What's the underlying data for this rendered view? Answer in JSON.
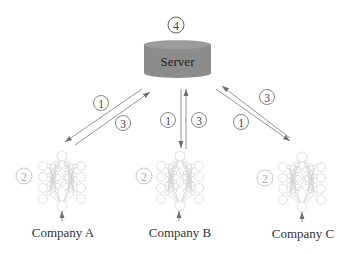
{
  "server": {
    "label": "Server",
    "step_badge": "4",
    "fill_color": "#8a8a8a",
    "top_color": "#9a9a9a"
  },
  "companies": [
    {
      "label": "Company A",
      "step_badge": "2"
    },
    {
      "label": "Company B",
      "step_badge": "2"
    },
    {
      "label": "Company C",
      "step_badge": "2"
    }
  ],
  "links": [
    {
      "company": "Company A",
      "down_step": "1",
      "up_step": "3"
    },
    {
      "company": "Company B",
      "down_step": "1",
      "up_step": "3"
    },
    {
      "company": "Company C",
      "down_step": "1",
      "up_step": "3"
    }
  ],
  "colors": {
    "arrow": "#7a7a7a",
    "badge_stroke": "#555555",
    "badge_text": "#444444",
    "local_badge": "#bbbbbb",
    "network": "#c8c8c8",
    "label_text": "#333333"
  }
}
